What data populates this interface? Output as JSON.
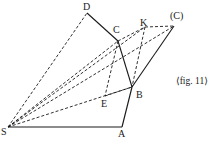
{
  "caption": "⟨fig. 11⟩",
  "points": {
    "S": {
      "label": "S",
      "x": 8,
      "y": 127,
      "lx": 1,
      "ly": 135
    },
    "A": {
      "label": "A",
      "x": 122,
      "y": 127,
      "lx": 118,
      "ly": 137
    },
    "B": {
      "label": "B",
      "x": 132,
      "y": 87,
      "lx": 136,
      "ly": 98
    },
    "C": {
      "label": "C",
      "x": 118,
      "y": 41,
      "lx": 113,
      "ly": 33
    },
    "D": {
      "label": "D",
      "x": 87,
      "y": 13,
      "lx": 83,
      "ly": 10
    },
    "K": {
      "label": "K",
      "x": 145,
      "y": 27,
      "lx": 140,
      "ly": 26
    },
    "C2": {
      "label": "(C)",
      "x": 174,
      "y": 26,
      "lx": 170,
      "ly": 19
    },
    "E": {
      "label": "E",
      "x": 105,
      "y": 96,
      "lx": 101,
      "ly": 107
    }
  },
  "solid_segments": [
    [
      "S",
      "A"
    ],
    [
      "A",
      "B"
    ],
    [
      "B",
      "C"
    ],
    [
      "C",
      "D"
    ],
    [
      "B",
      "C2"
    ]
  ],
  "dashed_segments": [
    [
      "S",
      "D"
    ],
    [
      "S",
      "C"
    ],
    [
      "S",
      "K"
    ],
    [
      "S",
      "B"
    ],
    [
      "S",
      "C2"
    ],
    [
      "C",
      "K"
    ],
    [
      "K",
      "C2"
    ],
    [
      "C",
      "E"
    ],
    [
      "E",
      "B"
    ],
    [
      "K",
      "B"
    ]
  ]
}
